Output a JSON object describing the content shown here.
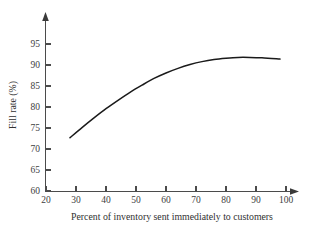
{
  "chart_data": {
    "type": "line",
    "title": "",
    "xlabel": "Percent of inventory sent immediately to customers",
    "ylabel": "Fill rate (%)",
    "xlim": [
      20,
      100
    ],
    "ylim": [
      60,
      97
    ],
    "xticks": [
      20,
      30,
      40,
      50,
      60,
      70,
      80,
      90,
      100
    ],
    "yticks": [
      60,
      65,
      70,
      75,
      80,
      85,
      90,
      95
    ],
    "xtick_labels": [
      "20",
      "30",
      "40",
      "50",
      "60",
      "70",
      "80",
      "90",
      "100"
    ],
    "ytick_labels": [
      "60",
      "65",
      "70",
      "75",
      "80",
      "85",
      "90",
      "95"
    ],
    "grid": false,
    "legend": false,
    "legend_position": "none",
    "series": [
      {
        "name": "Fill rate",
        "color": "#1a1a1a",
        "x": [
          28,
          32,
          36,
          40,
          44,
          48,
          52,
          56,
          60,
          64,
          68,
          72,
          76,
          80,
          84,
          88,
          92,
          98
        ],
        "y": [
          72.7,
          75.1,
          77.4,
          79.6,
          81.6,
          83.5,
          85.2,
          86.8,
          88.1,
          89.2,
          90.1,
          90.8,
          91.3,
          91.6,
          91.8,
          91.8,
          91.7,
          91.4
        ]
      }
    ],
    "annotations": []
  },
  "axes": {
    "x_axis_name": "x-axis",
    "y_axis_name": "y-axis",
    "arrow_x": "right-arrow",
    "arrow_y": "up-arrow"
  }
}
